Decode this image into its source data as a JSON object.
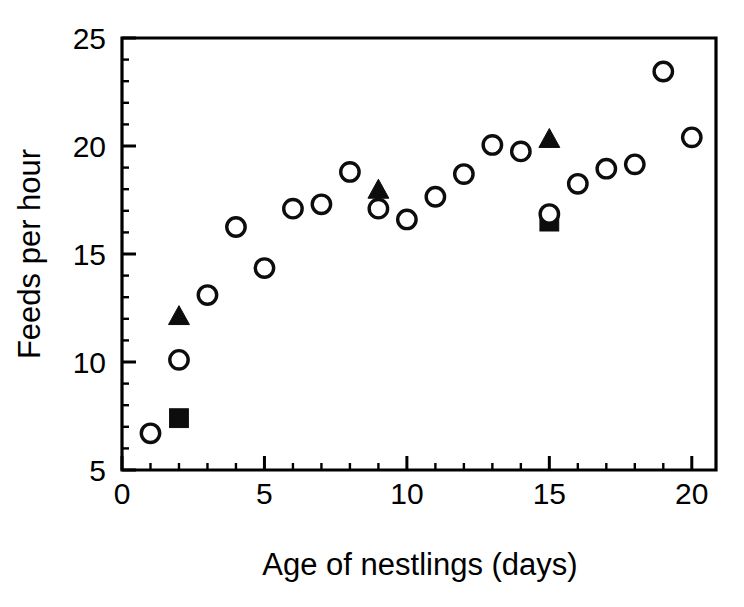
{
  "chart_data": {
    "type": "scatter",
    "title": "",
    "xlabel": "Age of nestlings (days)",
    "ylabel": "Feeds per hour",
    "xlim": [
      0,
      20.85
    ],
    "ylim": [
      5,
      25
    ],
    "xticks": [
      0,
      5,
      10,
      15,
      20
    ],
    "xtick_labels": [
      "0",
      "5",
      "10",
      "15",
      "20"
    ],
    "x_minor_ticks": [
      1,
      2,
      3,
      4,
      6,
      7,
      8,
      9,
      11,
      12,
      13,
      14,
      16,
      17,
      18,
      19
    ],
    "yticks": [
      5,
      10,
      15,
      20,
      25
    ],
    "ytick_labels": [
      "5",
      "10",
      "15",
      "20",
      "25"
    ],
    "y_minor_ticks": [
      6,
      7,
      8,
      9,
      11,
      12,
      13,
      14,
      16,
      17,
      18,
      19,
      21,
      22,
      23,
      24
    ],
    "grid": false,
    "legend": "none",
    "series": [
      {
        "name": "open-circle",
        "marker": "circle-open",
        "color": "#0d0d0d",
        "points": [
          {
            "x": 1,
            "y": 6.7
          },
          {
            "x": 2,
            "y": 10.1
          },
          {
            "x": 3,
            "y": 13.1
          },
          {
            "x": 4,
            "y": 16.25
          },
          {
            "x": 5,
            "y": 14.35
          },
          {
            "x": 6,
            "y": 17.1
          },
          {
            "x": 7,
            "y": 17.3
          },
          {
            "x": 8,
            "y": 18.8
          },
          {
            "x": 9,
            "y": 17.1
          },
          {
            "x": 10,
            "y": 16.6
          },
          {
            "x": 11,
            "y": 17.65
          },
          {
            "x": 12,
            "y": 18.7
          },
          {
            "x": 13,
            "y": 20.05
          },
          {
            "x": 14,
            "y": 19.75
          },
          {
            "x": 15,
            "y": 16.85
          },
          {
            "x": 16,
            "y": 18.25
          },
          {
            "x": 17,
            "y": 18.95
          },
          {
            "x": 18,
            "y": 19.15
          },
          {
            "x": 19,
            "y": 23.45
          },
          {
            "x": 20,
            "y": 20.4
          }
        ]
      },
      {
        "name": "filled-triangle",
        "marker": "triangle-filled",
        "color": "#0d0d0d",
        "points": [
          {
            "x": 2,
            "y": 12.1
          },
          {
            "x": 9,
            "y": 17.95
          },
          {
            "x": 15,
            "y": 20.3
          }
        ]
      },
      {
        "name": "filled-square",
        "marker": "square-filled",
        "color": "#0d0d0d",
        "points": [
          {
            "x": 2,
            "y": 7.4
          },
          {
            "x": 15,
            "y": 16.5
          }
        ]
      }
    ]
  }
}
